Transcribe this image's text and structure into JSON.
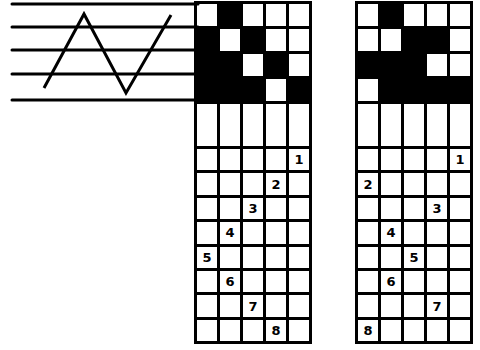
{
  "diagram": {
    "title": "",
    "colors": {
      "ink": "#000000",
      "paper": "#ffffff"
    },
    "treadling_staff": {
      "lines": 5,
      "zigzag_points": [
        [
          42,
          88
        ],
        [
          83,
          13
        ],
        [
          126,
          95
        ],
        [
          172,
          15
        ]
      ]
    },
    "left_draft": {
      "tieup": [
        [
          0,
          1,
          0,
          0,
          0
        ],
        [
          1,
          0,
          1,
          0,
          0
        ],
        [
          1,
          1,
          0,
          1,
          0
        ],
        [
          1,
          1,
          1,
          0,
          1
        ]
      ],
      "threading": [
        {
          "label": "1",
          "col": 5
        },
        {
          "label": "2",
          "col": 4
        },
        {
          "label": "3",
          "col": 3
        },
        {
          "label": "4",
          "col": 2
        },
        {
          "label": "5",
          "col": 1
        },
        {
          "label": "6",
          "col": 2
        },
        {
          "label": "7",
          "col": 3
        },
        {
          "label": "8",
          "col": 4
        }
      ]
    },
    "right_draft": {
      "tieup": [
        [
          0,
          1,
          0,
          0,
          0
        ],
        [
          0,
          0,
          1,
          1,
          0
        ],
        [
          1,
          1,
          1,
          0,
          0
        ],
        [
          0,
          1,
          1,
          1,
          1
        ]
      ],
      "threading": [
        {
          "label": "1",
          "col": 5
        },
        {
          "label": "2",
          "col": 1
        },
        {
          "label": "3",
          "col": 4
        },
        {
          "label": "4",
          "col": 2
        },
        {
          "label": "5",
          "col": 3
        },
        {
          "label": "6",
          "col": 2
        },
        {
          "label": "7",
          "col": 4
        },
        {
          "label": "8",
          "col": 1
        }
      ]
    }
  }
}
